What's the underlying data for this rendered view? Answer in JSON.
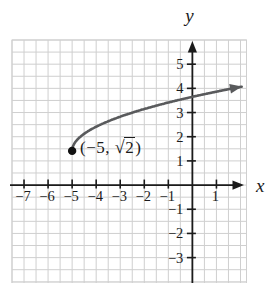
{
  "chart_data": {
    "type": "line",
    "title": "",
    "xlabel": "x",
    "ylabel": "y",
    "grid": {
      "on": true,
      "spacing_units": 0.5,
      "color": "#cfcfcf"
    },
    "axis_color": "#1b1b1b",
    "text_color": "#1b1b1b",
    "axes": {
      "x": {
        "label": "x",
        "min": -7.5,
        "max": 2.25,
        "ticks": [
          -7,
          -6,
          -5,
          -4,
          -3,
          -2,
          -1,
          1
        ],
        "tick_labels": [
          "−7",
          "−6",
          "−5",
          "−4",
          "−3",
          "−2",
          "−1",
          "1"
        ]
      },
      "y": {
        "label": "y",
        "min": -4.05,
        "max": 6.0,
        "ticks": [
          5,
          4,
          3,
          2,
          1,
          -1,
          -2,
          -3
        ],
        "tick_labels": [
          "5",
          "4",
          "3",
          "2",
          "1",
          "−1",
          "−2",
          "−3"
        ]
      }
    },
    "curve": {
      "function": "y = sqrt(x + 5) + sqrt(2)",
      "start_point": [
        -5,
        1.41421356
      ],
      "x_end": 2.06,
      "color": "#595a5c",
      "stroke_width": 2.6,
      "arrow_at_end": true,
      "sample_points": [
        [
          -5,
          1.41
        ],
        [
          -4,
          2.41
        ],
        [
          -3,
          2.83
        ],
        [
          -2,
          3.15
        ],
        [
          -1,
          3.41
        ],
        [
          0,
          3.65
        ],
        [
          1,
          3.86
        ],
        [
          2,
          4.06
        ]
      ]
    },
    "point": {
      "x": -5,
      "y": 1.41421356,
      "color": "#111111",
      "radius": 4.2
    },
    "annotation": {
      "text": "(−5, √2)",
      "prefix": "(−5, ",
      "radical_sign": "√",
      "radicand": "2",
      "suffix": ")"
    }
  }
}
